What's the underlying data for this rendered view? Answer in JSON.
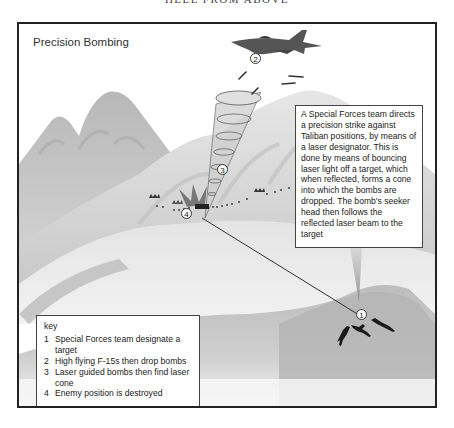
{
  "page": {
    "running_head": "HELL FROM ABOVE"
  },
  "figure": {
    "title": "Precision Bombing",
    "description": "A Special Forces team directs a precision strike against Taliban positions, by means of a laser designator. This is done by means of bouncing laser light off a target, which when reflected, forms a cone into which the bombs are dropped. The bomb's seeker head then follows the reflected laser beam to the target",
    "markers": [
      {
        "id": "1",
        "label": "1"
      },
      {
        "id": "2",
        "label": "2"
      },
      {
        "id": "3",
        "label": "3"
      },
      {
        "id": "4",
        "label": "4"
      }
    ],
    "key": {
      "title": "key",
      "items": [
        {
          "num": "1",
          "text": "Special Forces team designate a target"
        },
        {
          "num": "2",
          "text": "High flying F-15s then drop bombs"
        },
        {
          "num": "3",
          "text": "Laser guided bombs then find laser cone"
        },
        {
          "num": "4",
          "text": "Enemy position is destroyed"
        }
      ]
    },
    "icons": [
      "f15-jet-icon",
      "bomb-icon",
      "laser-cone-icon",
      "explosion-icon",
      "soldier-icon",
      "enemy-position-icon",
      "mountain-terrain"
    ]
  }
}
